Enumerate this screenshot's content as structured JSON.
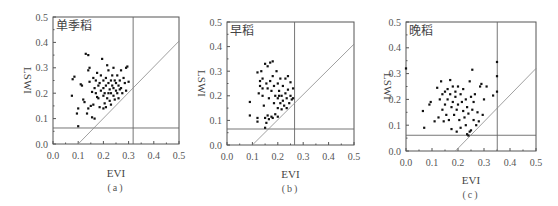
{
  "chart_data": [
    {
      "type": "scatter",
      "panel_label": "(a)",
      "title": "单季稻",
      "xlabel": "EVI",
      "ylabel": "LSWI",
      "xlim": [
        0,
        0.5
      ],
      "ylim": [
        0,
        0.5
      ],
      "xticks": [
        "0.0",
        "0.1",
        "0.2",
        "0.3",
        "0.4",
        "0.5"
      ],
      "yticks": [
        "0.0",
        "0.1",
        "0.2",
        "0.3",
        "0.4",
        "0.5"
      ],
      "grid": false,
      "threshold_lines": {
        "vertical_evi": 0.318,
        "horizontal_lswi": 0.063
      },
      "diagonal_line": {
        "x0": 0.1,
        "y0": 0.0,
        "x1": 0.5,
        "y1": 0.405
      },
      "points": [
        [
          0.075,
          0.19
        ],
        [
          0.078,
          0.255
        ],
        [
          0.085,
          0.265
        ],
        [
          0.095,
          0.12
        ],
        [
          0.1,
          0.14
        ],
        [
          0.1,
          0.07
        ],
        [
          0.11,
          0.235
        ],
        [
          0.115,
          0.23
        ],
        [
          0.12,
          0.175
        ],
        [
          0.125,
          0.165
        ],
        [
          0.13,
          0.355
        ],
        [
          0.14,
          0.35
        ],
        [
          0.135,
          0.12
        ],
        [
          0.14,
          0.14
        ],
        [
          0.14,
          0.29
        ],
        [
          0.145,
          0.3
        ],
        [
          0.15,
          0.15
        ],
        [
          0.155,
          0.105
        ],
        [
          0.165,
          0.1
        ],
        [
          0.16,
          0.26
        ],
        [
          0.165,
          0.22
        ],
        [
          0.17,
          0.2
        ],
        [
          0.17,
          0.25
        ],
        [
          0.175,
          0.28
        ],
        [
          0.18,
          0.18
        ],
        [
          0.18,
          0.23
        ],
        [
          0.185,
          0.24
        ],
        [
          0.19,
          0.21
        ],
        [
          0.19,
          0.27
        ],
        [
          0.195,
          0.335
        ],
        [
          0.2,
          0.19
        ],
        [
          0.2,
          0.22
        ],
        [
          0.2,
          0.25
        ],
        [
          0.205,
          0.16
        ],
        [
          0.205,
          0.2
        ],
        [
          0.21,
          0.23
        ],
        [
          0.21,
          0.26
        ],
        [
          0.215,
          0.18
        ],
        [
          0.215,
          0.31
        ],
        [
          0.22,
          0.2
        ],
        [
          0.22,
          0.24
        ],
        [
          0.22,
          0.29
        ],
        [
          0.225,
          0.215
        ],
        [
          0.225,
          0.17
        ],
        [
          0.23,
          0.25
        ],
        [
          0.23,
          0.2
        ],
        [
          0.235,
          0.23
        ],
        [
          0.235,
          0.27
        ],
        [
          0.24,
          0.19
        ],
        [
          0.24,
          0.22
        ],
        [
          0.24,
          0.3
        ],
        [
          0.245,
          0.25
        ],
        [
          0.245,
          0.175
        ],
        [
          0.25,
          0.21
        ],
        [
          0.25,
          0.24
        ],
        [
          0.255,
          0.2
        ],
        [
          0.255,
          0.27
        ],
        [
          0.26,
          0.23
        ],
        [
          0.26,
          0.18
        ],
        [
          0.265,
          0.25
        ],
        [
          0.27,
          0.22
        ],
        [
          0.27,
          0.29
        ],
        [
          0.275,
          0.2
        ],
        [
          0.28,
          0.26
        ],
        [
          0.285,
          0.24
        ],
        [
          0.29,
          0.3
        ],
        [
          0.295,
          0.305
        ],
        [
          0.29,
          0.21
        ],
        [
          0.3,
          0.245
        ],
        [
          0.16,
          0.155
        ],
        [
          0.185,
          0.145
        ],
        [
          0.2,
          0.14
        ],
        [
          0.21,
          0.145
        ],
        [
          0.23,
          0.155
        ],
        [
          0.175,
          0.185
        ],
        [
          0.155,
          0.205
        ],
        [
          0.145,
          0.245
        ],
        [
          0.265,
          0.215
        ]
      ]
    },
    {
      "type": "scatter",
      "panel_label": "(b)",
      "title": "早稻",
      "xlabel": "EVI",
      "ylabel": "LSWI",
      "xlim": [
        0,
        0.5
      ],
      "ylim": [
        0,
        0.5
      ],
      "xticks": [
        "0.0",
        "0.1",
        "0.2",
        "0.3",
        "0.4",
        "0.5"
      ],
      "yticks": [
        "0.0",
        "0.1",
        "0.2",
        "0.3",
        "0.4",
        "0.5"
      ],
      "grid": false,
      "threshold_lines": {
        "vertical_evi": 0.266,
        "horizontal_lswi": 0.065
      },
      "diagonal_line": {
        "x0": 0.1,
        "y0": 0.0,
        "x1": 0.5,
        "y1": 0.41
      },
      "points": [
        [
          0.09,
          0.12
        ],
        [
          0.09,
          0.175
        ],
        [
          0.12,
          0.11
        ],
        [
          0.12,
          0.095
        ],
        [
          0.12,
          0.295
        ],
        [
          0.125,
          0.21
        ],
        [
          0.13,
          0.24
        ],
        [
          0.135,
          0.3
        ],
        [
          0.14,
          0.27
        ],
        [
          0.14,
          0.2
        ],
        [
          0.145,
          0.16
        ],
        [
          0.15,
          0.33
        ],
        [
          0.15,
          0.11
        ],
        [
          0.15,
          0.07
        ],
        [
          0.155,
          0.25
        ],
        [
          0.155,
          0.09
        ],
        [
          0.16,
          0.32
        ],
        [
          0.16,
          0.23
        ],
        [
          0.165,
          0.19
        ],
        [
          0.165,
          0.105
        ],
        [
          0.17,
          0.335
        ],
        [
          0.17,
          0.26
        ],
        [
          0.175,
          0.22
        ],
        [
          0.175,
          0.115
        ],
        [
          0.18,
          0.34
        ],
        [
          0.18,
          0.28
        ],
        [
          0.185,
          0.24
        ],
        [
          0.185,
          0.17
        ],
        [
          0.19,
          0.2
        ],
        [
          0.19,
          0.125
        ],
        [
          0.195,
          0.3
        ],
        [
          0.2,
          0.25
        ],
        [
          0.2,
          0.19
        ],
        [
          0.2,
          0.15
        ],
        [
          0.205,
          0.22
        ],
        [
          0.21,
          0.27
        ],
        [
          0.21,
          0.17
        ],
        [
          0.215,
          0.2
        ],
        [
          0.215,
          0.145
        ],
        [
          0.22,
          0.24
        ],
        [
          0.22,
          0.18
        ],
        [
          0.225,
          0.16
        ],
        [
          0.23,
          0.21
        ],
        [
          0.23,
          0.27
        ],
        [
          0.235,
          0.19
        ],
        [
          0.235,
          0.15
        ],
        [
          0.24,
          0.28
        ],
        [
          0.24,
          0.225
        ],
        [
          0.245,
          0.17
        ],
        [
          0.25,
          0.2
        ],
        [
          0.25,
          0.255
        ],
        [
          0.255,
          0.185
        ],
        [
          0.26,
          0.23
        ],
        [
          0.26,
          0.19
        ],
        [
          0.2,
          0.115
        ],
        [
          0.18,
          0.11
        ],
        [
          0.16,
          0.12
        ],
        [
          0.14,
          0.23
        ],
        [
          0.13,
          0.26
        ],
        [
          0.205,
          0.2
        ]
      ]
    },
    {
      "type": "scatter",
      "panel_label": "(c)",
      "title": "晚稻",
      "xlabel": "EVI",
      "ylabel": "LSWI",
      "xlim": [
        0,
        0.5
      ],
      "ylim": [
        0,
        0.5
      ],
      "xticks": [
        "0.0",
        "0.1",
        "0.2",
        "0.3",
        "0.4",
        "0.5"
      ],
      "yticks": [
        "0.0",
        "0.1",
        "0.2",
        "0.3",
        "0.4",
        "0.5"
      ],
      "grid": false,
      "threshold_lines": {
        "vertical_evi": 0.351,
        "horizontal_lswi": 0.061
      },
      "diagonal_line": {
        "x0": 0.19,
        "y0": 0.0,
        "x1": 0.5,
        "y1": 0.32
      },
      "points": [
        [
          0.0,
          0.32
        ],
        [
          0.065,
          0.155
        ],
        [
          0.07,
          0.09
        ],
        [
          0.09,
          0.18
        ],
        [
          0.095,
          0.19
        ],
        [
          0.11,
          0.115
        ],
        [
          0.12,
          0.245
        ],
        [
          0.125,
          0.13
        ],
        [
          0.13,
          0.2
        ],
        [
          0.135,
          0.27
        ],
        [
          0.14,
          0.22
        ],
        [
          0.14,
          0.16
        ],
        [
          0.145,
          0.115
        ],
        [
          0.15,
          0.23
        ],
        [
          0.15,
          0.18
        ],
        [
          0.155,
          0.14
        ],
        [
          0.16,
          0.24
        ],
        [
          0.16,
          0.2
        ],
        [
          0.165,
          0.12
        ],
        [
          0.17,
          0.275
        ],
        [
          0.17,
          0.22
        ],
        [
          0.175,
          0.17
        ],
        [
          0.175,
          0.085
        ],
        [
          0.18,
          0.25
        ],
        [
          0.18,
          0.19
        ],
        [
          0.185,
          0.14
        ],
        [
          0.19,
          0.23
        ],
        [
          0.19,
          0.21
        ],
        [
          0.195,
          0.16
        ],
        [
          0.195,
          0.075
        ],
        [
          0.2,
          0.25
        ],
        [
          0.2,
          0.18
        ],
        [
          0.205,
          0.12
        ],
        [
          0.21,
          0.22
        ],
        [
          0.21,
          0.09
        ],
        [
          0.215,
          0.19
        ],
        [
          0.22,
          0.155
        ],
        [
          0.22,
          0.24
        ],
        [
          0.225,
          0.13
        ],
        [
          0.23,
          0.2
        ],
        [
          0.23,
          0.1
        ],
        [
          0.235,
          0.17
        ],
        [
          0.24,
          0.145
        ],
        [
          0.24,
          0.06
        ],
        [
          0.245,
          0.27
        ],
        [
          0.25,
          0.21
        ],
        [
          0.25,
          0.08
        ],
        [
          0.255,
          0.315
        ],
        [
          0.255,
          0.16
        ],
        [
          0.26,
          0.19
        ],
        [
          0.26,
          0.12
        ],
        [
          0.265,
          0.22
        ],
        [
          0.27,
          0.1
        ],
        [
          0.275,
          0.15
        ],
        [
          0.28,
          0.115
        ],
        [
          0.285,
          0.25
        ],
        [
          0.29,
          0.26
        ],
        [
          0.295,
          0.14
        ],
        [
          0.3,
          0.2
        ],
        [
          0.31,
          0.25
        ],
        [
          0.335,
          0.215
        ],
        [
          0.35,
          0.23
        ],
        [
          0.35,
          0.29
        ],
        [
          0.35,
          0.345
        ],
        [
          0.235,
          0.065
        ],
        [
          0.245,
          0.075
        ]
      ]
    }
  ]
}
